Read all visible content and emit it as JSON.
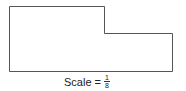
{
  "diagram": {
    "shape": "L-shaped floor plan outline",
    "points": [
      [
        9,
        6
      ],
      [
        104,
        6
      ],
      [
        104,
        33
      ],
      [
        172,
        33
      ],
      [
        172,
        71
      ],
      [
        9,
        71
      ]
    ],
    "stroke_color": "#555555"
  },
  "caption": {
    "label": "Scale =",
    "numerator": "1",
    "denominator": "8"
  }
}
